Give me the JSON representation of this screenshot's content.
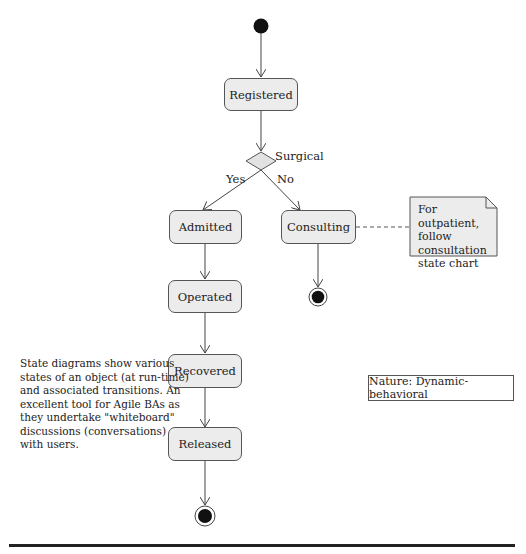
{
  "diagram": {
    "type": "UML state diagram",
    "states": [
      {
        "id": "registered",
        "label": "Registered"
      },
      {
        "id": "admitted",
        "label": "Admitted"
      },
      {
        "id": "consulting",
        "label": "Consulting"
      },
      {
        "id": "operated",
        "label": "Operated"
      },
      {
        "id": "recovered",
        "label": "Recovered"
      },
      {
        "id": "released",
        "label": "Released"
      }
    ],
    "decision": {
      "label": "Surgical",
      "yes_label": "Yes",
      "no_label": "No"
    },
    "note": {
      "lines": [
        "For outpatient,",
        "follow",
        "consultation",
        "state chart"
      ]
    },
    "description": "State diagrams show various states of an object (at run-time) and associated transitions. An excellent tool for Agile BAs as they undertake \"whiteboard\" discussions (conversations) with users.",
    "nature_box": "Nature: Dynamic-behavioral",
    "transitions": [
      {
        "from": "initial",
        "to": "registered"
      },
      {
        "from": "registered",
        "to": "decision"
      },
      {
        "from": "decision",
        "to": "admitted",
        "guard": "Yes"
      },
      {
        "from": "decision",
        "to": "consulting",
        "guard": "No"
      },
      {
        "from": "consulting",
        "to": "final"
      },
      {
        "from": "admitted",
        "to": "operated"
      },
      {
        "from": "operated",
        "to": "recovered"
      },
      {
        "from": "recovered",
        "to": "released"
      },
      {
        "from": "released",
        "to": "final"
      }
    ]
  }
}
